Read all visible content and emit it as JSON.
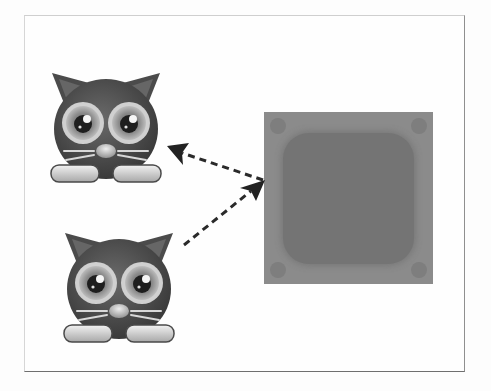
{
  "figure": {
    "type": "diagram",
    "nodes": [
      {
        "id": "cat-top",
        "kind": "cat-icon"
      },
      {
        "id": "cat-bottom",
        "kind": "cat-icon"
      },
      {
        "id": "block",
        "kind": "square-tile"
      }
    ],
    "edges": [
      {
        "from": "block",
        "to": "cat-top",
        "style": "dashed",
        "arrow": "to"
      },
      {
        "from": "cat-bottom",
        "to": "block",
        "style": "dashed",
        "arrow": "to"
      }
    ],
    "colors": {
      "cat_body": "#4a4a4a",
      "cat_eye_ring": "#c8c8c8",
      "box_outer": "#8b8b8b",
      "box_inner": "#747474",
      "arrow": "#2a2a2a",
      "frame_border": "#6f6f6f"
    }
  },
  "bleed_through": {
    "line1": "",
    "line2": ""
  }
}
